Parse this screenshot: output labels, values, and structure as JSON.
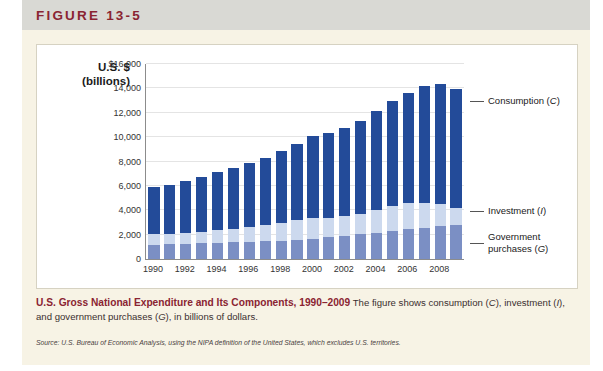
{
  "figure": {
    "label": "FIGURE 13-5"
  },
  "caption": {
    "title": "U.S. Gross National Expenditure and Its Components, 1990–2009",
    "body_1": "The figure shows consumption (",
    "c": "C",
    "body_2": "), investment (",
    "i": "I",
    "body_3": "), and government purchases (",
    "g": "G",
    "body_4": "), in billions of dollars.",
    "source": "Source: U.S. Bureau of Economic Analysis, using the NIPA definition of the United States, which excludes U.S. territories."
  },
  "annotations": {
    "consumption": "Consumption (",
    "consumption_sym": "C",
    "consumption_end": ")",
    "investment": "Investment (",
    "investment_sym": "I",
    "investment_end": ")",
    "government_l1": "Government",
    "government_l2": "purchases (",
    "government_sym": "G",
    "government_end": ")"
  },
  "colors": {
    "consumption": "#234b99",
    "investment": "#ccd9ee",
    "government": "#7b8fc4",
    "accent": "#8a2432",
    "page": "#f4f1e4"
  },
  "chart_data": {
    "type": "bar",
    "subtype": "stacked",
    "title": "U.S. Gross National Expenditure and Its Components, 1990–2009",
    "axis_title_line1": "U.S. $",
    "axis_title_line2": "(billions)",
    "xlabel": "",
    "ylabel": "U.S. $ (billions)",
    "ylim": [
      0,
      16000
    ],
    "ytick_values": [
      0,
      2000,
      4000,
      6000,
      8000,
      10000,
      12000,
      14000,
      16000
    ],
    "ytick_labels": [
      "0",
      "2,000",
      "4,000",
      "6,000",
      "8,000",
      "10,000",
      "12,000",
      "14,000",
      "$16,000"
    ],
    "grid": true,
    "legend_position": "right-annotations",
    "categories": [
      1990,
      1991,
      1992,
      1993,
      1994,
      1995,
      1996,
      1997,
      1998,
      1999,
      2000,
      2001,
      2002,
      2003,
      2004,
      2005,
      2006,
      2007,
      2008,
      2009
    ],
    "xtick_labels": [
      "1990",
      "1992",
      "1994",
      "1996",
      "1998",
      "2000",
      "2002",
      "2004",
      "2006",
      "2008"
    ],
    "series": [
      {
        "name": "Government purchases (G)",
        "symbol": "G",
        "color": "#7b8fc4",
        "values": [
          1180,
          1230,
          1270,
          1290,
          1320,
          1360,
          1400,
          1450,
          1510,
          1590,
          1680,
          1790,
          1920,
          2040,
          2160,
          2290,
          2430,
          2560,
          2720,
          2790
        ]
      },
      {
        "name": "Investment (I)",
        "symbol": "I",
        "color": "#ccd9ee",
        "values": [
          900,
          820,
          880,
          960,
          1090,
          1130,
          1230,
          1360,
          1480,
          1600,
          1720,
          1580,
          1570,
          1670,
          1880,
          2070,
          2170,
          2050,
          1800,
          1430
        ]
      },
      {
        "name": "Consumption (C)",
        "symbol": "C",
        "color": "#234b99",
        "values": [
          3820,
          4020,
          4250,
          4480,
          4740,
          4980,
          5240,
          5510,
          5840,
          6250,
          6670,
          6980,
          7290,
          7650,
          8100,
          8600,
          9050,
          9600,
          9850,
          9750
        ]
      }
    ],
    "totals": [
      5900,
      6070,
      6400,
      6730,
      7150,
      7470,
      7870,
      8320,
      8830,
      9440,
      10070,
      10350,
      10780,
      11360,
      12140,
      12960,
      13650,
      14210,
      14370,
      13970
    ]
  }
}
